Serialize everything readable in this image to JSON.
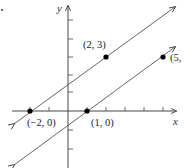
{
  "figure": {
    "axis_labels": {
      "x": "x",
      "y": "y"
    },
    "lines": [
      {
        "name": "upper-line",
        "through": [
          [
            -2,
            0
          ],
          [
            2,
            3
          ]
        ],
        "slope": 0.75
      },
      {
        "name": "lower-line",
        "through": [
          [
            1,
            0
          ],
          [
            5,
            3
          ]
        ],
        "slope": 0.75
      }
    ],
    "points": [
      {
        "x": -2,
        "y": 0,
        "label": "(−2, 0)"
      },
      {
        "x": 2,
        "y": 3,
        "label": "(2, 3)"
      },
      {
        "x": 1,
        "y": 0,
        "label": "(1, 0)"
      },
      {
        "x": 5,
        "y": 3,
        "label": "(5,"
      }
    ],
    "x_ticks": [
      -2,
      -1,
      1,
      2,
      3,
      4,
      5
    ],
    "y_ticks": [
      -2,
      -1,
      1,
      2,
      3,
      4,
      5
    ],
    "colors": {
      "line": "#555555",
      "point": "#000000",
      "axis": "#333333"
    }
  }
}
